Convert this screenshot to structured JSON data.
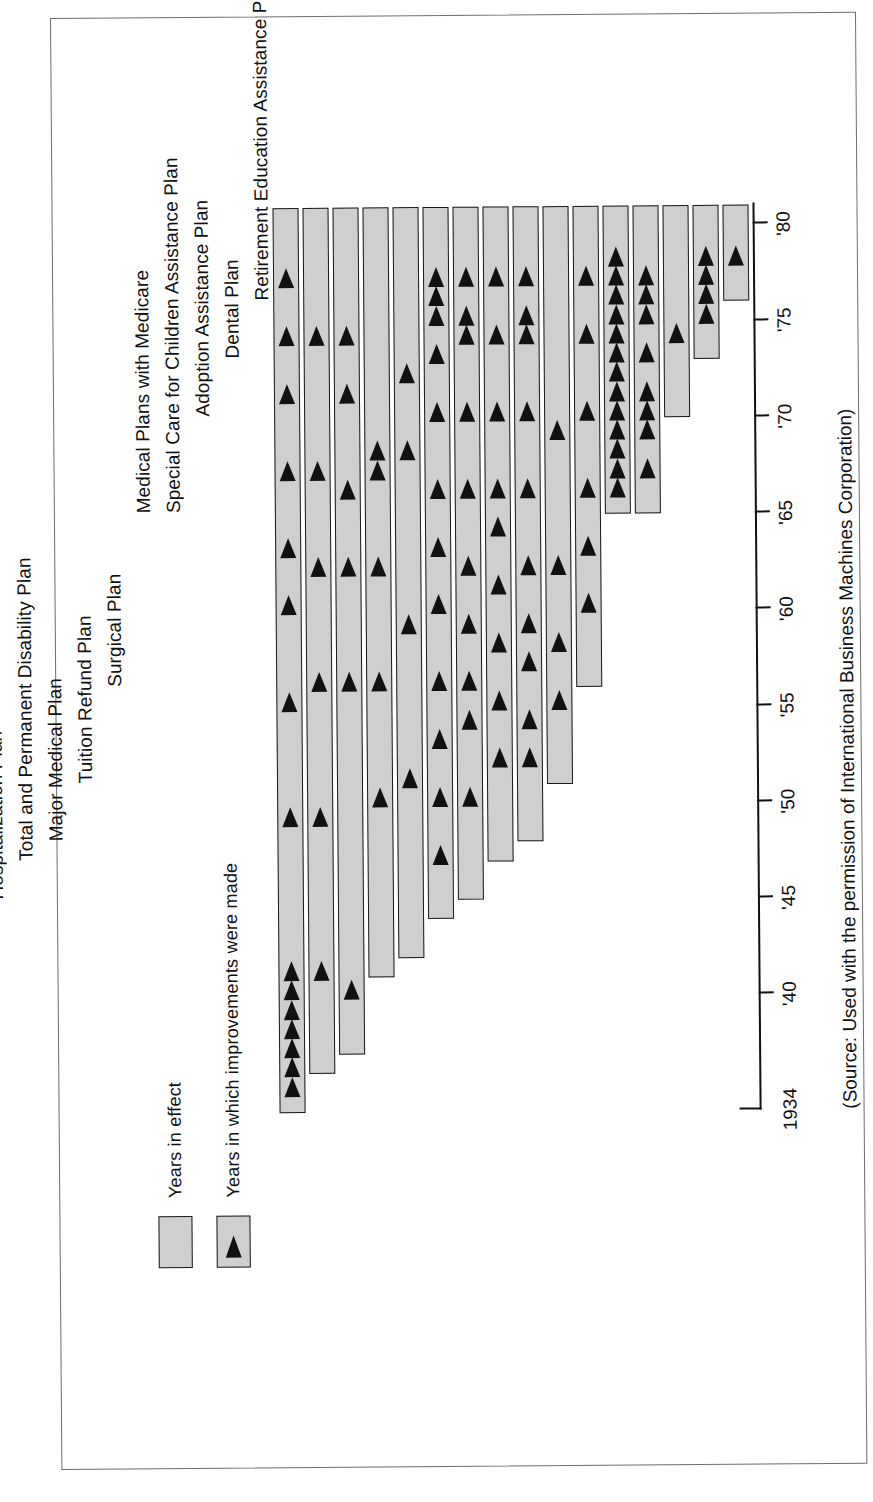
{
  "legend": {
    "items": [
      {
        "label": "Years in effect",
        "swatch": "gray-box",
        "marker": false
      },
      {
        "label": "Years in which improvements were made",
        "swatch": "gray-box-with-triangle",
        "marker": true
      }
    ]
  },
  "source_note": "(Source: Used with the permission of International Business Machines Corporation)",
  "axis": {
    "start_label": "1934",
    "tick_labels": [
      "'40",
      "'45",
      "'50",
      "'55",
      "'60",
      "'65",
      "'70",
      "'75",
      "'80"
    ],
    "tick_years": [
      1940,
      1945,
      1950,
      1955,
      1960,
      1965,
      1970,
      1975,
      1980
    ],
    "min_year": 1934,
    "max_year": 1981
  },
  "chart_data": {
    "type": "bar",
    "title": "",
    "subtitle": "",
    "xlabel": "",
    "ylabel": "",
    "xlim": [
      1934,
      1981
    ],
    "grid": false,
    "legend_position": "top-left",
    "orientation": "horizontal-timeline",
    "categories": [
      "Life Insurance and Survivors Income Plan",
      "Vacation Plan",
      "Holiday Plan",
      "Military Service Benefits Plan",
      "Sickness and Accident Plan",
      "Retirement Plan",
      "Hospitalization Plan",
      "Total and Permanent Disability Plan",
      "Major Medical Plan",
      "Tuition Refund Plan",
      "Surgical Plan",
      "Medical Plans with Medicare",
      "Special Care for Children Assistance Plan",
      "Adoption Assistance Plan",
      "Dental Plan",
      "Retirement Education Assistance Plan"
    ],
    "series": [
      {
        "name": "Years in effect",
        "bars": [
          {
            "category": "Life Insurance and Survivors Income Plan",
            "start": 1934,
            "end": 1981
          },
          {
            "category": "Vacation Plan",
            "start": 1936,
            "end": 1981
          },
          {
            "category": "Holiday Plan",
            "start": 1937,
            "end": 1981
          },
          {
            "category": "Military Service Benefits Plan",
            "start": 1941,
            "end": 1981
          },
          {
            "category": "Sickness and Accident Plan",
            "start": 1942,
            "end": 1981
          },
          {
            "category": "Retirement Plan",
            "start": 1944,
            "end": 1981
          },
          {
            "category": "Hospitalization Plan",
            "start": 1945,
            "end": 1981
          },
          {
            "category": "Total and Permanent Disability Plan",
            "start": 1947,
            "end": 1981
          },
          {
            "category": "Major Medical Plan",
            "start": 1948,
            "end": 1981
          },
          {
            "category": "Tuition Refund Plan",
            "start": 1951,
            "end": 1981
          },
          {
            "category": "Surgical Plan",
            "start": 1956,
            "end": 1981
          },
          {
            "category": "Medical Plans with Medicare",
            "start": 1965,
            "end": 1981
          },
          {
            "category": "Special Care for Children Assistance Plan",
            "start": 1965,
            "end": 1981
          },
          {
            "category": "Adoption Assistance Plan",
            "start": 1970,
            "end": 1981
          },
          {
            "category": "Dental Plan",
            "start": 1973,
            "end": 1981
          },
          {
            "category": "Retirement Education Assistance Plan",
            "start": 1976,
            "end": 1981
          }
        ]
      },
      {
        "name": "Years in which improvements were made",
        "markers": [
          {
            "category": "Life Insurance and Survivors Income Plan",
            "years": [
              1935,
              1936,
              1937,
              1938,
              1939,
              1940,
              1941,
              1949,
              1955,
              1960,
              1963,
              1967,
              1971,
              1974,
              1977
            ]
          },
          {
            "category": "Vacation Plan",
            "years": [
              1941,
              1949,
              1956,
              1962,
              1967,
              1974
            ]
          },
          {
            "category": "Holiday Plan",
            "years": [
              1940,
              1956,
              1962,
              1966,
              1971,
              1974
            ]
          },
          {
            "category": "Military Service Benefits Plan",
            "years": [
              1950,
              1956,
              1962,
              1967,
              1968
            ]
          },
          {
            "category": "Sickness and Accident Plan",
            "years": [
              1951,
              1959,
              1968,
              1972
            ]
          },
          {
            "category": "Retirement Plan",
            "years": [
              1947,
              1950,
              1953,
              1956,
              1960,
              1963,
              1966,
              1970,
              1973,
              1975,
              1976,
              1977
            ]
          },
          {
            "category": "Hospitalization Plan",
            "years": [
              1950,
              1954,
              1956,
              1959,
              1962,
              1966,
              1970,
              1974,
              1975,
              1977
            ]
          },
          {
            "category": "Total and Permanent Disability Plan",
            "years": [
              1952,
              1955,
              1958,
              1961,
              1964,
              1966,
              1970,
              1974,
              1977
            ]
          },
          {
            "category": "Major Medical Plan",
            "years": [
              1952,
              1954,
              1957,
              1959,
              1962,
              1966,
              1970,
              1974,
              1975,
              1977
            ]
          },
          {
            "category": "Tuition Refund Plan",
            "years": [
              1955,
              1958,
              1962,
              1969
            ]
          },
          {
            "category": "Surgical Plan",
            "years": [
              1960,
              1963,
              1966,
              1970,
              1974,
              1977
            ]
          },
          {
            "category": "Medical Plans with Medicare",
            "years": [
              1966,
              1967,
              1968,
              1969,
              1970,
              1971,
              1972,
              1973,
              1974,
              1975,
              1976,
              1977,
              1978
            ]
          },
          {
            "category": "Special Care for Children Assistance Plan",
            "years": [
              1967,
              1969,
              1970,
              1971,
              1973,
              1975,
              1976,
              1977
            ]
          },
          {
            "category": "Adoption Assistance Plan",
            "years": [
              1974
            ]
          },
          {
            "category": "Dental Plan",
            "years": [
              1975,
              1976,
              1977,
              1978
            ]
          },
          {
            "category": "Retirement Education Assistance Plan",
            "years": [
              1978
            ]
          }
        ]
      }
    ]
  }
}
